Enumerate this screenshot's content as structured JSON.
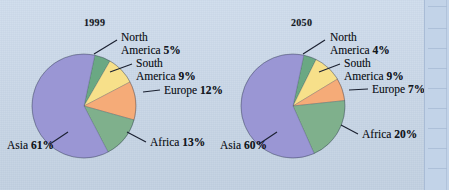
{
  "figure": {
    "background_color": "#c9d8ea",
    "kind": "two-pie-comparison"
  },
  "charts": [
    {
      "title": "1999",
      "slices": [
        {
          "name": "North America",
          "label": "North",
          "label2": "America",
          "value": 5,
          "pct": "5%",
          "color": "#6aa883"
        },
        {
          "name": "South America",
          "label": "South",
          "label2": "America",
          "value": 9,
          "pct": "9%",
          "color": "#f7e08a"
        },
        {
          "name": "Europe",
          "label": "Europe",
          "label2": "",
          "value": 12,
          "pct": "12%",
          "color": "#f5ab78"
        },
        {
          "name": "Africa",
          "label": "Africa",
          "label2": "",
          "value": 13,
          "pct": "13%",
          "color": "#7fb08c"
        },
        {
          "name": "Asia",
          "label": "Asia",
          "label2": "",
          "value": 61,
          "pct": "61%",
          "color": "#9a96d4"
        }
      ]
    },
    {
      "title": "2050",
      "slices": [
        {
          "name": "North America",
          "label": "North",
          "label2": "America",
          "value": 4,
          "pct": "4%",
          "color": "#6aa883"
        },
        {
          "name": "South America",
          "label": "South",
          "label2": "America",
          "value": 9,
          "pct": "9%",
          "color": "#f7e08a"
        },
        {
          "name": "Europe",
          "label": "Europe",
          "label2": "",
          "value": 7,
          "pct": "7%",
          "color": "#f5ab78"
        },
        {
          "name": "Africa",
          "label": "Africa",
          "label2": "",
          "value": 20,
          "pct": "20%",
          "color": "#7fb08c"
        },
        {
          "name": "Asia",
          "label": "Asia",
          "label2": "",
          "value": 60,
          "pct": "60%",
          "color": "#9a96d4"
        }
      ]
    }
  ],
  "chart_data": [
    {
      "type": "pie",
      "title": "1999",
      "categories": [
        "North America",
        "South America",
        "Europe",
        "Africa",
        "Asia"
      ],
      "values": [
        5,
        9,
        12,
        13,
        61
      ],
      "unit": "percent",
      "colors": [
        "#6aa883",
        "#f7e08a",
        "#f5ab78",
        "#7fb08c",
        "#9a96d4"
      ],
      "labels": [
        "North America 5%",
        "South America 9%",
        "Europe 12%",
        "Africa 13%",
        "Asia 61%"
      ],
      "legend": "callout-labels-with-leader-lines",
      "xlabel": "",
      "ylabel": ""
    },
    {
      "type": "pie",
      "title": "2050",
      "categories": [
        "North America",
        "South America",
        "Europe",
        "Africa",
        "Asia"
      ],
      "values": [
        4,
        9,
        7,
        20,
        60
      ],
      "unit": "percent",
      "colors": [
        "#6aa883",
        "#f7e08a",
        "#f5ab78",
        "#7fb08c",
        "#9a96d4"
      ],
      "labels": [
        "North America 4%",
        "South America 9%",
        "Europe 7%",
        "Africa 20%",
        "Asia 60%"
      ],
      "legend": "callout-labels-with-leader-lines",
      "xlabel": "",
      "ylabel": ""
    }
  ]
}
